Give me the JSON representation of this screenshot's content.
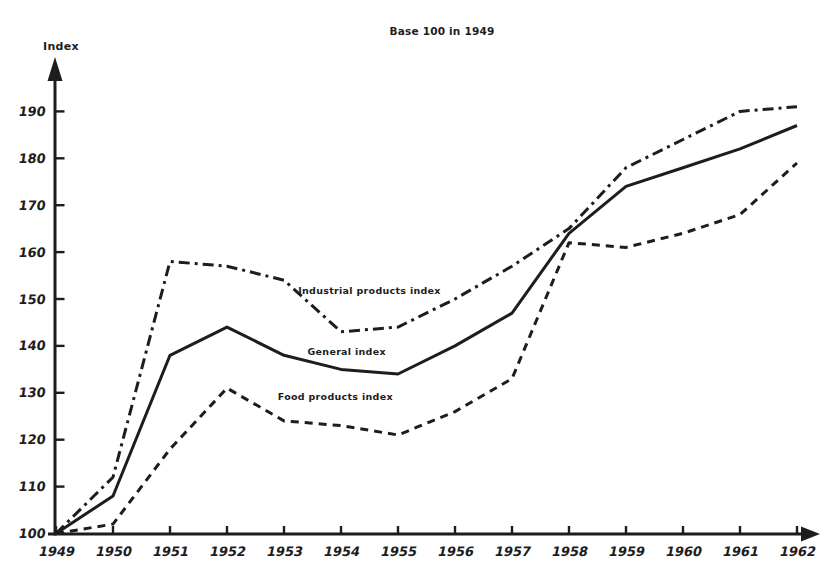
{
  "title": "Base 100 in 1949",
  "y_axis_title": "Index",
  "ink_color": "#1d1d1d",
  "background_color": "#ffffff",
  "chart_data": {
    "type": "line",
    "title": "Base 100 in 1949",
    "xlabel": "",
    "ylabel": "Index",
    "grid": false,
    "legend_position": "inline labels beside each line",
    "x": [
      1949,
      1950,
      1951,
      1952,
      1953,
      1954,
      1955,
      1956,
      1957,
      1958,
      1959,
      1960,
      1961,
      1962
    ],
    "x_tick_labels": [
      "1949",
      "1950",
      "1951",
      "1952",
      "1953",
      "1954",
      "1955",
      "1956",
      "1957",
      "1958",
      "1959",
      "1960",
      "1961",
      "1962"
    ],
    "y_ticks": [
      100,
      110,
      120,
      130,
      140,
      150,
      160,
      170,
      180,
      190
    ],
    "ylim": [
      100,
      196
    ],
    "series": [
      {
        "name": "Industrial products index",
        "line_style": "dash-dot",
        "values": [
          100,
          112,
          158,
          157,
          154,
          143,
          144,
          150,
          157,
          165,
          178,
          184,
          190,
          191
        ],
        "label_anchor": {
          "year": 1954.5,
          "value": 151
        }
      },
      {
        "name": "General index",
        "line_style": "solid",
        "values": [
          100,
          108,
          138,
          144,
          138,
          135,
          134,
          140,
          147,
          164,
          174,
          178,
          182,
          187
        ],
        "label_anchor": {
          "year": 1954.1,
          "value": 138
        }
      },
      {
        "name": "Food products index",
        "line_style": "dashed",
        "values": [
          100,
          102,
          118,
          131,
          124,
          123,
          121,
          126,
          133,
          162,
          161,
          164,
          168,
          179
        ],
        "label_anchor": {
          "year": 1953.9,
          "value": 128.5
        }
      }
    ]
  }
}
